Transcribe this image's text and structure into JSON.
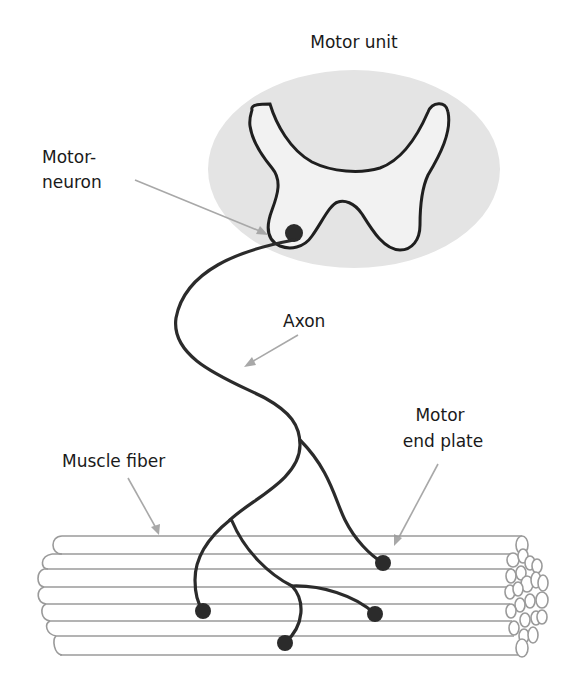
{
  "title": "Motor unit",
  "labels": {
    "motor_neuron_line1": "Motor-",
    "motor_neuron_line2": "neuron",
    "axon": "Axon",
    "motor_end_plate_line1": "Motor",
    "motor_end_plate_line2": "end plate",
    "muscle_fiber": "Muscle fiber"
  },
  "colors": {
    "spinal_cord_background": "#e4e4e4",
    "gray_matter_fill": "#f2f2f2",
    "axon": "#2b2b2b",
    "fiber_outline": "#9a9a9a",
    "pointer": "#a8a8a8"
  },
  "elements": {
    "spinal_cord_cross_section": "ellipse",
    "gray_matter": "butterfly-shape",
    "motor_neuron_soma": "filled-circle",
    "axon_terminals_count": 5,
    "muscle_fibers_count": 7
  }
}
